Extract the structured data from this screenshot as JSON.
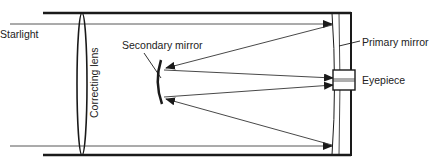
{
  "diagram": {
    "labels": {
      "starlight": "Starlight",
      "correcting_lens": "Correcting lens",
      "secondary_mirror": "Secondary mirror",
      "primary_mirror": "Primary mirror",
      "eyepiece": "Eyepiece"
    },
    "colors": {
      "line": "#1a1a1a",
      "background": "#ffffff"
    }
  }
}
